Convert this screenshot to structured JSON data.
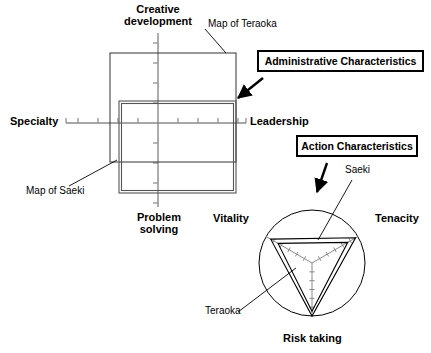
{
  "figure": {
    "width": 431,
    "height": 353,
    "background": "#ffffff",
    "ink": "#000000",
    "grid_gray": "#8a8a8a"
  },
  "callouts": [
    {
      "key": "administrative",
      "label": "Administrative Characteristics",
      "x": 257,
      "y": 50,
      "w": 167,
      "h": 22,
      "font_size": 10.5,
      "arrow": {
        "x1": 263,
        "y1": 78,
        "x2": 238,
        "y2": 98
      }
    },
    {
      "key": "action",
      "label": "Action Characteristics",
      "x": 296,
      "y": 135,
      "w": 122,
      "h": 22,
      "font_size": 10.5,
      "arrow": {
        "x1": 327,
        "y1": 163,
        "x2": 317,
        "y2": 192
      }
    }
  ],
  "left_chart": {
    "name": "Administrative Characteristics Map",
    "axes": {
      "top_label": "Creative\ndevelopment",
      "bottom_label": "Problem\nsolving",
      "left_label": "Specialty",
      "right_label": "Leadership",
      "center": {
        "x": 158,
        "y": 123
      },
      "vertical": {
        "x": 158,
        "y_top": 33,
        "y_bottom": 207
      },
      "horizontal": {
        "y": 123,
        "x_left": 66,
        "x_right": 246
      },
      "tick_count_h": 9,
      "tick_count_v": 9,
      "tick_spacing": 20,
      "tick_len": 5
    },
    "series": [
      {
        "name": "Map of Teraoka",
        "style": "thin",
        "stroke": "#333333",
        "stroke_width": 1,
        "rect": {
          "x": 110,
          "y": 53,
          "w": 126,
          "h": 109
        },
        "leader": {
          "x1": 205,
          "y1": 29,
          "x2": 226,
          "y2": 53
        },
        "label_x": 208,
        "label_y": 19
      },
      {
        "name": "Map of Saeki",
        "style": "double",
        "stroke": "#555555",
        "stroke_width": 1,
        "rect": {
          "x": 119,
          "y": 101,
          "w": 117,
          "h": 92
        },
        "leader": {
          "x1": 69,
          "y1": 186,
          "x2": 117,
          "y2": 160
        },
        "label_x": 26,
        "label_y": 186
      }
    ]
  },
  "right_chart": {
    "name": "Action Characteristics Radar",
    "center": {
      "x": 312,
      "y": 263
    },
    "radius": 53,
    "axis_labels": [
      {
        "key": "vitality",
        "text": "Vitality",
        "angle_deg": 210,
        "x": 213,
        "y": 213
      },
      {
        "key": "tenacity",
        "text": "Tenacity",
        "angle_deg": 330,
        "x": 375,
        "y": 213
      },
      {
        "key": "risk_taking",
        "text": "Risk taking",
        "angle_deg": 90,
        "x": 283,
        "y": 335
      }
    ],
    "spoke_ticks": 5,
    "series": [
      {
        "name": "Saeki",
        "style": "outer",
        "stroke": "#000000",
        "stroke_width": 1.1,
        "values": {
          "vitality": 0.9,
          "tenacity": 0.95,
          "risk_taking": 1.0
        },
        "leader": {
          "x1": 352,
          "y1": 180,
          "x2": 318,
          "y2": 240
        },
        "label_x": 345,
        "label_y": 171
      },
      {
        "name": "Teraoka",
        "style": "inner",
        "stroke": "#000000",
        "stroke_width": 1.1,
        "values": {
          "vitality": 0.74,
          "tenacity": 0.78,
          "risk_taking": 0.91
        },
        "leader": {
          "x1": 238,
          "y1": 312,
          "x2": 296,
          "y2": 268
        },
        "label_x": 205,
        "label_y": 312
      }
    ]
  },
  "chart_data": {
    "type": "radar",
    "charts": [
      {
        "type": "bar",
        "subtitle": "Administrative Characteristics",
        "categories": [
          "Creative development",
          "Leadership",
          "Problem solving",
          "Specialty"
        ],
        "axis_note": "Four-direction cross plot; each person's profile drawn as a rectangle",
        "series": [
          {
            "name": "Map of Teraoka",
            "values": [
              0.9,
              0.78,
              0.39,
              0.48
            ]
          },
          {
            "name": "Map of Saeki",
            "values": [
              0.22,
              0.78,
              0.7,
              0.39
            ]
          }
        ],
        "xlabel": "Specialty – Leadership",
        "ylabel": "Creative development – Problem solving",
        "xlim": [
          -1,
          1
        ],
        "ylim": [
          -1,
          1
        ],
        "grid": false,
        "legend": "inline-leader-lines"
      },
      {
        "type": "radar",
        "subtitle": "Action Characteristics",
        "categories": [
          "Vitality",
          "Tenacity",
          "Risk taking"
        ],
        "series": [
          {
            "name": "Saeki",
            "values": [
              0.9,
              0.95,
              1.0
            ]
          },
          {
            "name": "Teraoka",
            "values": [
              0.74,
              0.78,
              0.91
            ]
          }
        ],
        "rlim": [
          0,
          1
        ],
        "grid": false,
        "legend": "inline-leader-lines"
      }
    ]
  }
}
